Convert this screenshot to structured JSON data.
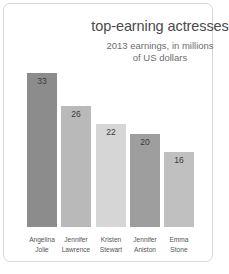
{
  "chart_data": {
    "type": "bar",
    "title": "top-earning actresses",
    "subtitle_line1": "2013 earnings, in millions",
    "subtitle_line2": "of US dollars",
    "xlabel": "",
    "ylabel": "",
    "ylim": [
      0,
      33
    ],
    "grid": false,
    "legend": "none",
    "categories": [
      "Angelina Jolie",
      "Jennifer Lawrence",
      "Kristen Stewart",
      "Jennifer Aniston",
      "Emma Stone"
    ],
    "category_lines": [
      [
        "Angelina",
        "Jolie"
      ],
      [
        "Jennifer",
        "Lawrence"
      ],
      [
        "Kristen",
        "Stewart"
      ],
      [
        "Jennifer",
        "Aniston"
      ],
      [
        "Emma",
        "Stone"
      ]
    ],
    "values": [
      33,
      26,
      22,
      20,
      16
    ],
    "value_labels": [
      "33",
      "26",
      "22",
      "20",
      "16"
    ],
    "bar_colors": [
      "#8c8c8c",
      "#b9b9b9",
      "#d6d6d6",
      "#9e9e9e",
      "#c0c0c0"
    ],
    "background_color": "#ffffff",
    "border_color": "#d8d8d8",
    "title_color": "#4a4a4a",
    "subtitle_color": "#6e6e6e",
    "label_color": "#555555"
  }
}
